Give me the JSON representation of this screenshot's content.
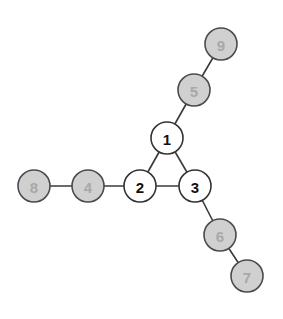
{
  "diagram": {
    "type": "graph",
    "nodes": [
      {
        "id": "1",
        "label": "1",
        "x": 167,
        "y": 138,
        "style": "white"
      },
      {
        "id": "2",
        "label": "2",
        "x": 140,
        "y": 186,
        "style": "white"
      },
      {
        "id": "3",
        "label": "3",
        "x": 195,
        "y": 186,
        "style": "white"
      },
      {
        "id": "4",
        "label": "4",
        "x": 88,
        "y": 186,
        "style": "gray"
      },
      {
        "id": "5",
        "label": "5",
        "x": 194,
        "y": 90,
        "style": "gray"
      },
      {
        "id": "6",
        "label": "6",
        "x": 220,
        "y": 235,
        "style": "gray"
      },
      {
        "id": "7",
        "label": "7",
        "x": 247,
        "y": 276,
        "style": "gray"
      },
      {
        "id": "8",
        "label": "8",
        "x": 34,
        "y": 186,
        "style": "gray"
      },
      {
        "id": "9",
        "label": "9",
        "x": 221,
        "y": 44,
        "style": "gray"
      }
    ],
    "edges": [
      [
        "1",
        "2"
      ],
      [
        "1",
        "3"
      ],
      [
        "2",
        "3"
      ],
      [
        "1",
        "5"
      ],
      [
        "5",
        "9"
      ],
      [
        "2",
        "4"
      ],
      [
        "4",
        "8"
      ],
      [
        "3",
        "6"
      ],
      [
        "6",
        "7"
      ]
    ],
    "colors": {
      "white_fill": "#ffffff",
      "gray_fill": "#d0d0d0",
      "stroke": "#333333",
      "white_label": "#111111",
      "gray_label": "#a8a8a8"
    }
  }
}
